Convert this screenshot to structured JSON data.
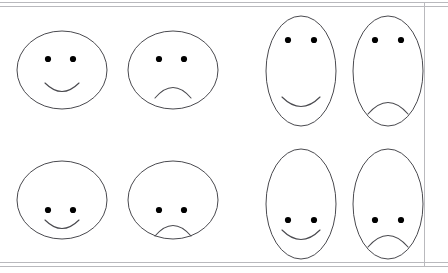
{
  "figure": {
    "background_color": "#ffffff",
    "frame_color": "#b9b9bd",
    "outline_color": "#4a4a4f",
    "eye_color": "#000000",
    "width": 448,
    "height": 273,
    "rows": 2,
    "columns": 4,
    "frame": {
      "rules": [
        {
          "name": "top-outer",
          "orientation": "horizontal",
          "y": 2
        },
        {
          "name": "top-inner",
          "orientation": "horizontal",
          "y": 6
        },
        {
          "name": "bottom-inner",
          "orientation": "horizontal",
          "y": 262
        },
        {
          "name": "bottom-outer",
          "orientation": "horizontal",
          "y": 266
        },
        {
          "name": "right",
          "orientation": "vertical",
          "x": 424
        }
      ]
    }
  },
  "faces": [
    {
      "id": "face-1",
      "label": "wide-happy-high",
      "row": 1,
      "column": 1,
      "shape": "wide-ellipse",
      "expression": "happy",
      "feature_position": "high",
      "box": {
        "x": 16,
        "y": 30,
        "w": 92,
        "h": 80
      },
      "ellipse": {
        "cx": 46,
        "cy": 40,
        "rx": 45,
        "ry": 39
      },
      "eyes": [
        {
          "cx": 32,
          "cy": 29,
          "r": 3.1
        },
        {
          "cx": 57,
          "cy": 29,
          "r": 3.1
        }
      ],
      "mouth": "M 29 53 Q 46 70 63 53"
    },
    {
      "id": "face-2",
      "label": "wide-sad-high",
      "row": 1,
      "column": 2,
      "shape": "wide-ellipse",
      "expression": "sad",
      "feature_position": "high",
      "box": {
        "x": 127,
        "y": 30,
        "w": 92,
        "h": 80
      },
      "ellipse": {
        "cx": 46,
        "cy": 40,
        "rx": 45,
        "ry": 39
      },
      "eyes": [
        {
          "cx": 32,
          "cy": 29,
          "r": 3.1
        },
        {
          "cx": 57,
          "cy": 29,
          "r": 3.1
        }
      ],
      "mouth": "M 28 68 Q 46 47 64 68"
    },
    {
      "id": "face-3",
      "label": "tall-happy-high",
      "row": 1,
      "column": 3,
      "shape": "tall-ellipse",
      "expression": "happy",
      "feature_position": "high",
      "box": {
        "x": 265,
        "y": 15,
        "w": 72,
        "h": 112
      },
      "ellipse": {
        "cx": 36,
        "cy": 56,
        "rx": 35,
        "ry": 55
      },
      "eyes": [
        {
          "cx": 23,
          "cy": 25,
          "r": 3.1
        },
        {
          "cx": 49,
          "cy": 25,
          "r": 3.1
        }
      ],
      "mouth": "M 17 82 Q 36 101 55 82"
    },
    {
      "id": "face-4",
      "label": "tall-sad-high",
      "row": 1,
      "column": 4,
      "shape": "tall-ellipse",
      "expression": "sad",
      "feature_position": "high",
      "box": {
        "x": 352,
        "y": 15,
        "w": 72,
        "h": 112
      },
      "ellipse": {
        "cx": 36,
        "cy": 56,
        "rx": 35,
        "ry": 55
      },
      "eyes": [
        {
          "cx": 23,
          "cy": 25,
          "r": 3.1
        },
        {
          "cx": 49,
          "cy": 25,
          "r": 3.1
        }
      ],
      "mouth": "M 16 99 Q 36 76 56 99"
    },
    {
      "id": "face-5",
      "label": "wide-happy-low",
      "row": 2,
      "column": 1,
      "shape": "wide-ellipse",
      "expression": "happy",
      "feature_position": "low",
      "box": {
        "x": 16,
        "y": 160,
        "w": 92,
        "h": 80
      },
      "ellipse": {
        "cx": 46,
        "cy": 40,
        "rx": 45,
        "ry": 39
      },
      "eyes": [
        {
          "cx": 32,
          "cy": 50,
          "r": 3.1
        },
        {
          "cx": 57,
          "cy": 50,
          "r": 3.1
        }
      ],
      "mouth": "M 29 60 Q 46 77 63 60"
    },
    {
      "id": "face-6",
      "label": "wide-sad-low",
      "row": 2,
      "column": 2,
      "shape": "wide-ellipse",
      "expression": "sad",
      "feature_position": "low",
      "box": {
        "x": 127,
        "y": 160,
        "w": 92,
        "h": 80
      },
      "ellipse": {
        "cx": 46,
        "cy": 40,
        "rx": 45,
        "ry": 39
      },
      "eyes": [
        {
          "cx": 32,
          "cy": 50,
          "r": 3.1
        },
        {
          "cx": 57,
          "cy": 50,
          "r": 3.1
        }
      ],
      "mouth": "M 28 76 Q 46 55 64 76"
    },
    {
      "id": "face-7",
      "label": "tall-happy-low",
      "row": 2,
      "column": 3,
      "shape": "tall-ellipse",
      "expression": "happy",
      "feature_position": "low",
      "box": {
        "x": 265,
        "y": 148,
        "w": 72,
        "h": 112
      },
      "ellipse": {
        "cx": 36,
        "cy": 56,
        "rx": 35,
        "ry": 55
      },
      "eyes": [
        {
          "cx": 23,
          "cy": 72,
          "r": 3.1
        },
        {
          "cx": 49,
          "cy": 72,
          "r": 3.1
        }
      ],
      "mouth": "M 17 82 Q 36 101 55 82"
    },
    {
      "id": "face-8",
      "label": "tall-sad-low",
      "row": 2,
      "column": 4,
      "shape": "tall-ellipse",
      "expression": "sad",
      "feature_position": "low",
      "box": {
        "x": 352,
        "y": 148,
        "w": 72,
        "h": 112
      },
      "ellipse": {
        "cx": 36,
        "cy": 56,
        "rx": 35,
        "ry": 55
      },
      "eyes": [
        {
          "cx": 23,
          "cy": 72,
          "r": 3.1
        },
        {
          "cx": 49,
          "cy": 72,
          "r": 3.1
        }
      ],
      "mouth": "M 16 99 Q 36 76 56 99"
    }
  ]
}
